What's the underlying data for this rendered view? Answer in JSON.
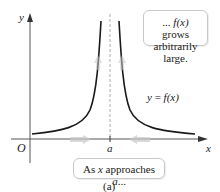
{
  "figure": {
    "caption": "(a)",
    "axes": {
      "x_label": "x",
      "y_label": "y",
      "origin_label": "O",
      "asymptote_label": "a"
    },
    "curve_label": {
      "prefix": "y = ",
      "func": "f(x)"
    },
    "callout_top": {
      "line1_prefix": "... ",
      "line1_func": "f(x)",
      "line1_suffix": " grows",
      "line2": "arbitrarily large."
    },
    "callout_bottom": {
      "prefix": "As ",
      "var": "x",
      "middle": " approaches ",
      "target": "a",
      "suffix": "..."
    },
    "colors": {
      "curve": "#1a1a1a",
      "axis": "#555555",
      "asymptote": "#9a9a9a",
      "motion_arrow": "#c8c8c8",
      "callout_border": "#c9c9c9"
    }
  }
}
